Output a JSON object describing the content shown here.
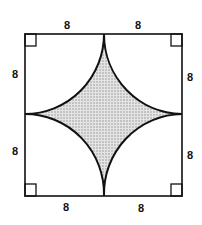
{
  "diagram": {
    "labels": {
      "top_left": "8",
      "top_right": "8",
      "left_top": "8",
      "left_bottom": "8",
      "right_top": "8",
      "right_bottom": "8",
      "bottom_left": "8",
      "bottom_right": "8"
    },
    "colors": {
      "stroke": "#111111",
      "shade": "#c8c8c8"
    }
  }
}
